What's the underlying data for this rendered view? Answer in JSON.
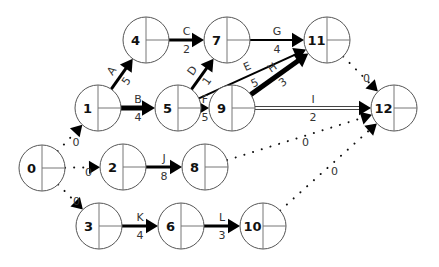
{
  "diagram": {
    "type": "activity-on-arrow network",
    "nodes": [
      {
        "id": "0",
        "x": 42,
        "y": 168
      },
      {
        "id": "1",
        "x": 98,
        "y": 108
      },
      {
        "id": "2",
        "x": 123,
        "y": 167
      },
      {
        "id": "3",
        "x": 99,
        "y": 226
      },
      {
        "id": "4",
        "x": 146,
        "y": 40
      },
      {
        "id": "5",
        "x": 178,
        "y": 108
      },
      {
        "id": "6",
        "x": 181,
        "y": 226
      },
      {
        "id": "7",
        "x": 227,
        "y": 40
      },
      {
        "id": "8",
        "x": 205,
        "y": 167
      },
      {
        "id": "9",
        "x": 232,
        "y": 108
      },
      {
        "id": "10",
        "x": 263,
        "y": 226
      },
      {
        "id": "11",
        "x": 327,
        "y": 40
      },
      {
        "id": "12",
        "x": 394,
        "y": 108
      }
    ],
    "activities": [
      {
        "name": "A",
        "from": "1",
        "to": "4",
        "duration": "5",
        "style": "thick"
      },
      {
        "name": "B",
        "from": "1",
        "to": "5",
        "duration": "4",
        "style": "bold"
      },
      {
        "name": "C",
        "from": "4",
        "to": "7",
        "duration": "2",
        "style": "thick"
      },
      {
        "name": "D",
        "from": "5",
        "to": "7",
        "duration": "1",
        "style": "thick"
      },
      {
        "name": "E",
        "from": "5",
        "to": "11",
        "duration": "5",
        "style": "normal"
      },
      {
        "name": "F",
        "from": "5",
        "to": "9",
        "duration": "5",
        "style": "bold"
      },
      {
        "name": "G",
        "from": "7",
        "to": "11",
        "duration": "4",
        "style": "normal"
      },
      {
        "name": "H",
        "from": "9",
        "to": "11",
        "duration": "3",
        "style": "bold"
      },
      {
        "name": "I",
        "from": "9",
        "to": "12",
        "duration": "2",
        "style": "double"
      },
      {
        "name": "J",
        "from": "2",
        "to": "8",
        "duration": "8",
        "style": "thick"
      },
      {
        "name": "K",
        "from": "3",
        "to": "6",
        "duration": "4",
        "style": "thick"
      },
      {
        "name": "L",
        "from": "6",
        "to": "10",
        "duration": "3",
        "style": "thick"
      }
    ],
    "dummies": [
      {
        "from": "0",
        "to": "1",
        "duration": "0"
      },
      {
        "from": "0",
        "to": "2",
        "duration": "0"
      },
      {
        "from": "0",
        "to": "3",
        "duration": "0"
      },
      {
        "from": "11",
        "to": "12",
        "duration": "0"
      },
      {
        "from": "8",
        "to": "12",
        "duration": "0"
      },
      {
        "from": "10",
        "to": "12",
        "duration": "0"
      }
    ]
  }
}
